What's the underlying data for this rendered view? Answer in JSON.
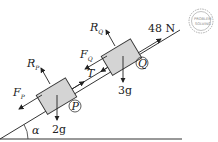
{
  "diagram": {
    "angle_label": "α",
    "applied_force": "48 N",
    "tension_label": "T",
    "particles": [
      {
        "id": "P",
        "label": "P",
        "weight": "2g",
        "reaction": "R",
        "reaction_sub": "P",
        "friction": "F",
        "friction_sub": "P"
      },
      {
        "id": "Q",
        "label": "Q",
        "weight": "3g",
        "reaction": "R",
        "reaction_sub": "Q",
        "friction": "F",
        "friction_sub": "Q"
      }
    ],
    "stamp": {
      "line1": "PROBLEM",
      "line2": "SOLVING"
    },
    "colors": {
      "block_fill": "#d4d4d4",
      "line": "#222222",
      "stamp": "#999999"
    }
  }
}
